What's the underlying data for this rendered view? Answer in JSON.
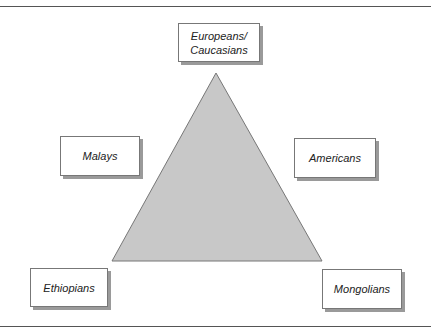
{
  "diagram": {
    "type": "triangle-with-labels",
    "triangle": {
      "fill": "#c8c8c8",
      "stroke": "#777777",
      "vertices": [
        [
          216,
          73
        ],
        [
          112,
          261
        ],
        [
          322,
          261
        ]
      ]
    },
    "labels": [
      {
        "id": "europeans",
        "line1": "Europeans/",
        "line2": "Caucasians",
        "position": "top"
      },
      {
        "id": "malays",
        "text": "Malays",
        "position": "upper-left"
      },
      {
        "id": "americans",
        "text": "Americans",
        "position": "upper-right"
      },
      {
        "id": "ethiopians",
        "text": "Ethiopians",
        "position": "bottom-left"
      },
      {
        "id": "mongolians",
        "text": "Mongolians",
        "position": "bottom-right"
      }
    ]
  }
}
